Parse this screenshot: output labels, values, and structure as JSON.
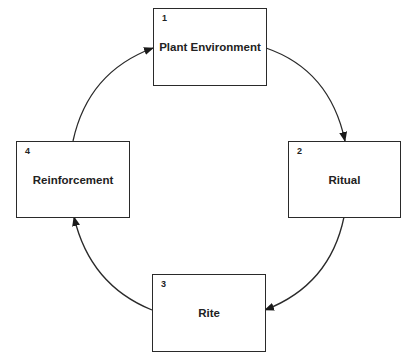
{
  "diagram": {
    "type": "cycle",
    "nodes": [
      {
        "number": "1",
        "label": "Plant Environment"
      },
      {
        "number": "2",
        "label": "Ritual"
      },
      {
        "number": "3",
        "label": "Rite"
      },
      {
        "number": "4",
        "label": "Reinforcement"
      }
    ],
    "edges": [
      {
        "from": "1",
        "to": "2"
      },
      {
        "from": "2",
        "to": "3"
      },
      {
        "from": "3",
        "to": "4"
      },
      {
        "from": "4",
        "to": "1"
      }
    ],
    "colors": {
      "stroke": "#2a2a2a",
      "background": "#ffffff"
    }
  }
}
